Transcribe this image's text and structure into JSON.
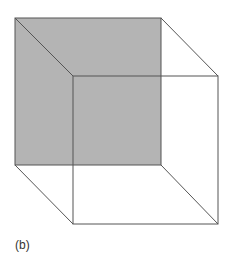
{
  "figure": {
    "label": "(b)",
    "colors": {
      "shaded_face": "#b4b4b4",
      "edges": "#555555",
      "background": "#ffffff"
    },
    "back_face": {
      "x1": 15,
      "y1": 18,
      "x2": 161,
      "y2": 165
    },
    "front_face": {
      "x1": 73,
      "y1": 76,
      "x2": 218,
      "y2": 224
    }
  }
}
